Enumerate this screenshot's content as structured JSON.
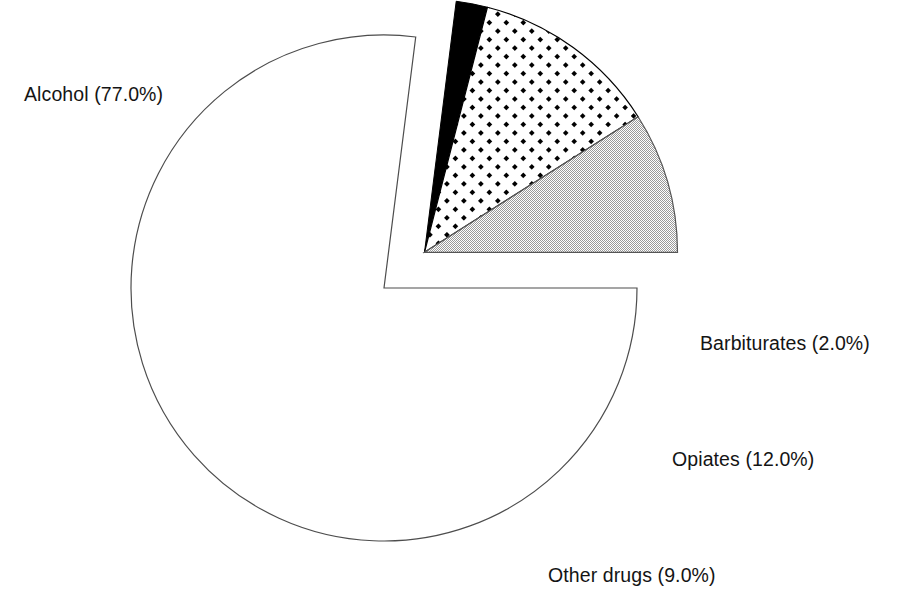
{
  "chart_data": {
    "type": "pie",
    "title": "",
    "subtitle": "",
    "xlabel": "",
    "ylabel": "",
    "grid": false,
    "legend": "none",
    "label_format": "{name} ({value}%)",
    "start_angle_deg": 0,
    "direction": "clockwise",
    "categories": [
      "Alcohol",
      "Barbiturates",
      "Opiates",
      "Other drugs"
    ],
    "values": [
      77.0,
      12.0,
      9.0,
      2.0
    ],
    "slices": [
      {
        "name": "Alcohol",
        "value": 77.0,
        "label": "Alcohol (77.0%)",
        "fill_style": "white",
        "fill_color": "#ffffff",
        "stroke_color": "#4d4d4d",
        "exploded": false,
        "start_deg": 0,
        "sweep_deg": 277.2
      },
      {
        "name": "Barbiturates",
        "value": 2.0,
        "label": "Barbiturates (2.0%)",
        "fill_style": "solid-black",
        "fill_color": "#000000",
        "stroke_color": "#000000",
        "exploded": true,
        "start_deg": 277.2,
        "sweep_deg": 7.2
      },
      {
        "name": "Opiates",
        "value": 12.0,
        "label": "Opiates (12.0%)",
        "fill_style": "diagonal-dot-hatch",
        "fill_color": "#000000",
        "stroke_color": "#000000",
        "exploded": true,
        "start_deg": 284.4,
        "sweep_deg": 43.2
      },
      {
        "name": "Other drugs",
        "value": 9.0,
        "label": "Other drugs (9.0%)",
        "fill_style": "gray-dither",
        "fill_color": "#c6c6c6",
        "stroke_color": "#555555",
        "exploded": true,
        "start_deg": 327.6,
        "sweep_deg": 32.4
      }
    ]
  },
  "geometry": {
    "center_x": 384,
    "center_y": 288,
    "radius": 253,
    "explode_offset": 54,
    "explode_bisector_deg": 318.6
  },
  "labels": {
    "alcohol": "Alcohol (77.0%)",
    "barbiturates": "Barbiturates (2.0%)",
    "opiates": "Opiates (12.0%)",
    "other_drugs": "Other drugs (9.0%)"
  }
}
